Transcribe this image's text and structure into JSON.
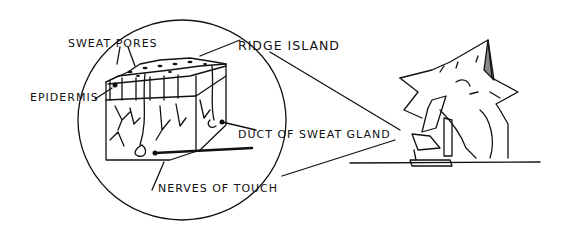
{
  "figure": {
    "ink_color": "#111111",
    "background": "#ffffff"
  },
  "labels": {
    "sweat_pores": "SWEAT PORES",
    "ridge_island": "RIDGE ISLAND",
    "epidermis": "EPIDERMIS",
    "duct_of_sweat_gland": "DUCT OF SWEAT GLAND",
    "nerves_of_touch": "NERVES OF TOUCH"
  },
  "elements": {
    "magnifier_circle": "magnified view circle",
    "skin_block": "skin cross-section block",
    "cat": "cat character",
    "microscope": "microscope",
    "table": "table line"
  }
}
